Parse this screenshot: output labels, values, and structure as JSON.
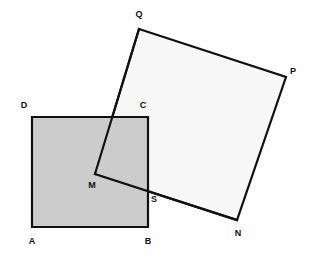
{
  "figure": {
    "canvas": {
      "width": 311,
      "height": 268
    },
    "background_color": "#ffffff",
    "stroke_color": "#111111",
    "stroke_width": 2.2,
    "shapes": [
      {
        "name": "square-abcd",
        "label": "ABCD",
        "fill": "#cccccc",
        "points": "32,117 148,117 148,227 32,227"
      },
      {
        "name": "square-qpnm",
        "label": "QPNM",
        "fill": "#f7f7f7",
        "points": "139,29 286,77 237,220 95,174"
      }
    ],
    "vertices": [
      {
        "name": "vertex-d",
        "label": "D",
        "x": 32,
        "y": 117,
        "label_x": 24,
        "label_y": 105
      },
      {
        "name": "vertex-c",
        "label": "C",
        "x": 148,
        "y": 117,
        "label_x": 143,
        "label_y": 105
      },
      {
        "name": "vertex-a",
        "label": "A",
        "x": 32,
        "y": 227,
        "label_x": 32,
        "label_y": 241
      },
      {
        "name": "vertex-b",
        "label": "B",
        "x": 148,
        "y": 227,
        "label_x": 148,
        "label_y": 241
      },
      {
        "name": "vertex-q",
        "label": "Q",
        "x": 139,
        "y": 29,
        "label_x": 139,
        "label_y": 14
      },
      {
        "name": "vertex-p",
        "label": "P",
        "x": 286,
        "y": 77,
        "label_x": 293,
        "label_y": 71
      },
      {
        "name": "vertex-n",
        "label": "N",
        "x": 237,
        "y": 220,
        "label_x": 238,
        "label_y": 233
      },
      {
        "name": "vertex-m",
        "label": "M",
        "x": 95,
        "y": 174,
        "label_x": 92,
        "label_y": 185
      },
      {
        "name": "point-s",
        "label": "S",
        "x": 148,
        "y": 189,
        "label_x": 154,
        "label_y": 199
      }
    ]
  }
}
